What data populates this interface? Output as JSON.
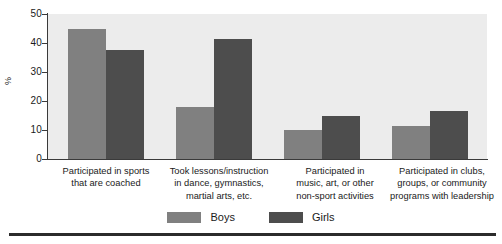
{
  "chart_data": {
    "type": "bar",
    "title": "",
    "subtitle": "",
    "xlabel": "",
    "ylabel": "%",
    "ylim": [
      0,
      50
    ],
    "yticks": [
      "0",
      "10",
      "20",
      "30",
      "40",
      "50"
    ],
    "grid": false,
    "legend_position": "bottom-center",
    "categories": [
      "Participated in sports\nthat are coached",
      "Took lessons/instruction\nin dance, gymnastics,\nmartial arts, etc.",
      "Participated in\nmusic, art, or other\nnon-sport activities",
      "Participated in clubs,\ngroups, or community\nprograms with leadership"
    ],
    "category_lines": [
      [
        "Participated in sports",
        "that are coached"
      ],
      [
        "Took lessons/instruction",
        "in dance, gymnastics,",
        "martial arts, etc."
      ],
      [
        "Participated in",
        "music, art, or other",
        "non-sport activities"
      ],
      [
        "Participated in clubs,",
        "groups, or community",
        "programs with leadership"
      ]
    ],
    "series": [
      {
        "name": "Boys",
        "color": "#808080",
        "values": [
          45.0,
          18.0,
          10.0,
          11.5
        ]
      },
      {
        "name": "Girls",
        "color": "#4d4d4d",
        "values": [
          37.5,
          41.5,
          15.0,
          16.5
        ]
      }
    ]
  },
  "legend": {
    "items": [
      {
        "label": "Boys"
      },
      {
        "label": "Girls"
      }
    ]
  },
  "colors": {
    "boys": "#808080",
    "girls": "#4d4d4d",
    "plot_background": "#ececec",
    "axis": "#3a3a3a",
    "text": "#1a1a1a",
    "rule": "#2b2b2b"
  }
}
